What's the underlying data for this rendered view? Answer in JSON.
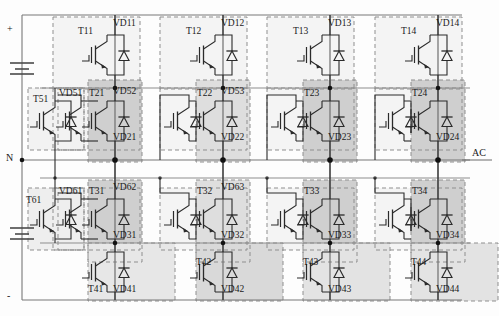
{
  "diagram": {
    "rail_labels": {
      "positive": "+",
      "neutral": "N",
      "negative": "-",
      "output": "AC"
    },
    "colors": {
      "wire": "#6b6b6b",
      "device_line": "#2b2b2b",
      "dashed_box": "#8a8a8a",
      "fill_light": "#f2f2f2",
      "fill_mid": "#e0e0e0",
      "fill_dark": "#cdcdcd",
      "node": "#111111",
      "background": "#fdfdfd"
    },
    "devices": [
      {
        "transistor": "T11",
        "diode": "VD11",
        "row": 1,
        "col": 1
      },
      {
        "transistor": "T12",
        "diode": "VD12",
        "row": 1,
        "col": 2
      },
      {
        "transistor": "T13",
        "diode": "VD13",
        "row": 1,
        "col": 3
      },
      {
        "transistor": "T14",
        "diode": "VD14",
        "row": 1,
        "col": 4
      },
      {
        "transistor": "T21",
        "diode": "VD21",
        "diode2": "VD52",
        "row": 2,
        "col": 1
      },
      {
        "transistor": "T22",
        "diode": "VD22",
        "diode2": "VD53",
        "row": 2,
        "col": 2
      },
      {
        "transistor": "T23",
        "diode": "VD23",
        "row": 2,
        "col": 3
      },
      {
        "transistor": "T24",
        "diode": "VD24",
        "row": 2,
        "col": 4
      },
      {
        "transistor": "T31",
        "diode": "VD31",
        "diode2": "VD62",
        "row": 3,
        "col": 1
      },
      {
        "transistor": "T32",
        "diode": "VD32",
        "diode2": "VD63",
        "row": 3,
        "col": 2
      },
      {
        "transistor": "T33",
        "diode": "VD33",
        "row": 3,
        "col": 3
      },
      {
        "transistor": "T34",
        "diode": "VD34",
        "row": 3,
        "col": 4
      },
      {
        "transistor": "T41",
        "diode": "VD41",
        "row": 4,
        "col": 1
      },
      {
        "transistor": "T42",
        "diode": "VD42",
        "row": 4,
        "col": 2
      },
      {
        "transistor": "T43",
        "diode": "VD43",
        "row": 4,
        "col": 3
      },
      {
        "transistor": "T44",
        "diode": "VD44",
        "row": 4,
        "col": 4
      },
      {
        "transistor": "T51",
        "diode": "VD51",
        "row": 2,
        "col": 0
      },
      {
        "transistor": "T61",
        "diode": "VD61",
        "row": 3,
        "col": 0
      }
    ],
    "labels": {
      "T11": "T11",
      "VD11": "VD11",
      "T12": "T12",
      "VD12": "VD12",
      "T13": "T13",
      "VD13": "VD13",
      "T14": "T14",
      "VD14": "VD14",
      "T21": "T21",
      "VD21": "VD21",
      "VD52": "VD52",
      "T22": "T22",
      "VD22": "VD22",
      "VD53": "VD53",
      "T23": "T23",
      "VD23": "VD23",
      "T24": "T24",
      "VD24": "VD24",
      "T31": "T31",
      "VD31": "VD31",
      "VD62": "VD62",
      "T32": "T32",
      "VD32": "VD32",
      "VD63": "VD63",
      "T33": "T33",
      "VD33": "VD33",
      "T34": "T34",
      "VD34": "VD34",
      "T41": "T41",
      "VD41": "VD41",
      "T42": "T42",
      "VD42": "VD42",
      "T43": "T43",
      "VD43": "VD43",
      "T44": "T44",
      "VD44": "VD44",
      "T51": "T51",
      "VD51": "VD51",
      "T61": "T61",
      "VD61": "VD61"
    }
  }
}
